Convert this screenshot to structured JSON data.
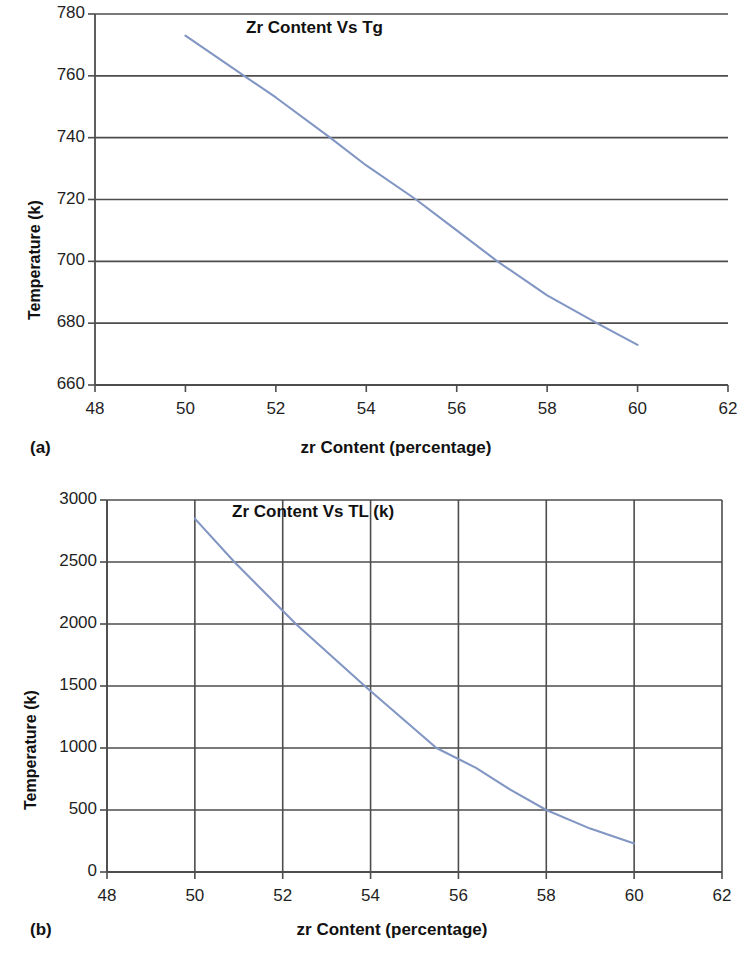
{
  "figure": {
    "background": "#ffffff",
    "panels": [
      {
        "letter": "(a)",
        "xaxis_title": "zr Content (percentage)",
        "yaxis_title": "Temperature (k)"
      },
      {
        "letter": "(b)",
        "xaxis_title": "zr Content (percentage)",
        "yaxis_title": "Temperature (k)"
      }
    ]
  },
  "chart_data": [
    {
      "type": "line",
      "title": "Zr Content Vs Tg",
      "xlabel": "zr Content (percentage)",
      "ylabel": "Temperature (k)",
      "xlim": [
        48,
        62
      ],
      "ylim": [
        660,
        780
      ],
      "xticks": [
        48,
        50,
        52,
        54,
        56,
        58,
        60,
        62
      ],
      "xtick_labels": [
        "48",
        "50",
        "52",
        "54",
        "56",
        "58",
        "60",
        "62"
      ],
      "yticks": [
        660,
        680,
        700,
        720,
        740,
        760,
        780
      ],
      "ytick_labels": [
        "660",
        "680",
        "700",
        "720",
        "740",
        "760",
        "780"
      ],
      "grid": {
        "horizontal": true,
        "vertical": false
      },
      "legend": null,
      "series": [
        {
          "name": "Tg",
          "color": "#8296c4",
          "x": [
            50.0,
            51.3,
            52.0,
            53.2,
            54.0,
            55.1,
            56.0,
            56.9,
            58.0,
            59.1,
            60.0
          ],
          "y": [
            773,
            760,
            753,
            740,
            731,
            720,
            710,
            700,
            689,
            680,
            673
          ]
        }
      ]
    },
    {
      "type": "line",
      "title": "Zr Content Vs TL (k)",
      "xlabel": "zr Content (percentage)",
      "ylabel": "Temperature (k)",
      "xlim": [
        48,
        62
      ],
      "ylim": [
        0,
        3000
      ],
      "xticks": [
        48,
        50,
        52,
        54,
        56,
        58,
        60,
        62
      ],
      "xtick_labels": [
        "48",
        "50",
        "52",
        "54",
        "56",
        "58",
        "60",
        "62"
      ],
      "yticks": [
        0,
        500,
        1000,
        1500,
        2000,
        2500,
        3000
      ],
      "ytick_labels": [
        "0",
        "500",
        "1000",
        "1500",
        "2000",
        "2500",
        "3000"
      ],
      "grid": {
        "horizontal": true,
        "vertical": true
      },
      "legend": null,
      "series": [
        {
          "name": "TL (k)",
          "color": "#8296c4",
          "x": [
            50.0,
            50.9,
            52.3,
            53.9,
            55.5,
            56.4,
            57.2,
            58.0,
            59.0,
            60.0
          ],
          "y": [
            2850,
            2500,
            2000,
            1490,
            1000,
            840,
            660,
            500,
            350,
            230
          ]
        }
      ]
    }
  ]
}
